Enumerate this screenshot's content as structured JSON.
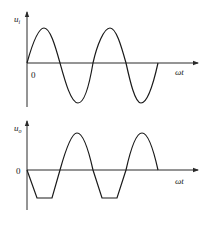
{
  "diagram": {
    "top_plot": {
      "y_label": "u",
      "y_label_sub": "i",
      "x_label": "ωt",
      "origin_label": "0",
      "description": "Sinusoidal input voltage, two full cycles"
    },
    "bottom_plot": {
      "y_label": "u",
      "y_label_sub": "o",
      "x_label": "ωt",
      "origin_label": "0",
      "description": "Output voltage: inverted input with negative half-cycles clipped (flat bottoms)"
    },
    "colors": {
      "line": "#1a1a1a",
      "background": "#ffffff"
    }
  }
}
